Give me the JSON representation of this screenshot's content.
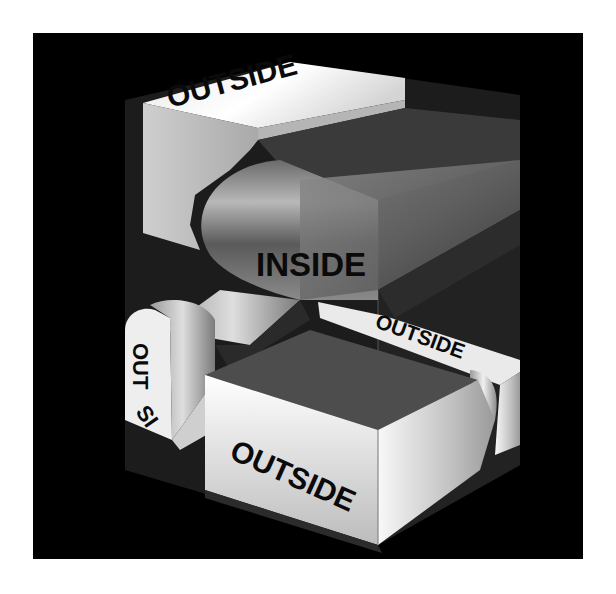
{
  "figure": {
    "background_color": "#ffffff",
    "panel_color": "#000000"
  },
  "labels": {
    "top": "OUTSIDE",
    "center": "INSIDE",
    "right": "OUTSIDE",
    "left_top": "OUT",
    "left_bottom": "SI",
    "bottom": "OUTSIDE"
  },
  "colors": {
    "band_light": "#f2f2f2",
    "band_mid": "#bdbdbd",
    "band_dark": "#5a5a5a",
    "inner_face": "#4a4a4a",
    "cube_face": "#2a2a2a",
    "text": "#0a0a0a"
  }
}
